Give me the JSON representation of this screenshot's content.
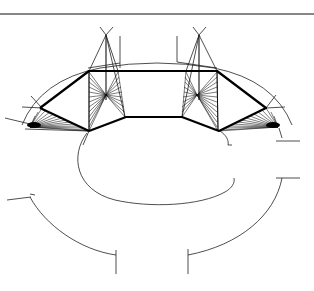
{
  "diagram": {
    "stroke_color": "#000000",
    "background": "#ffffff",
    "top_rule": {
      "x1": 0,
      "y1": 14,
      "x2": 314,
      "y2": 14
    },
    "frame_polygon": [
      [
        40,
        108
      ],
      [
        89,
        71
      ],
      [
        217,
        71
      ],
      [
        266,
        108
      ],
      [
        219,
        131
      ],
      [
        182,
        117
      ],
      [
        126,
        117
      ],
      [
        89,
        131
      ],
      [
        40,
        108
      ]
    ],
    "inner_quads": {
      "left": [
        [
          89,
          71
        ],
        [
          125,
          117
        ]
      ],
      "right": [
        [
          217,
          71
        ],
        [
          182,
          117
        ]
      ]
    },
    "fan_centers": {
      "left_top": [
        106,
        95
      ],
      "right_top": [
        197,
        95
      ],
      "left_bottom": [
        30,
        127
      ],
      "right_bottom": [
        278,
        127
      ]
    },
    "apexes": {
      "left": [
        106,
        35
      ],
      "right": [
        199,
        35
      ]
    },
    "ellipse_arc": {
      "cx": 157,
      "cy": 166,
      "rx": 80,
      "ry": 36
    },
    "outer_arcs": {
      "left": {
        "start": [
          30,
          197
        ],
        "end": [
          116,
          255
        ]
      },
      "right": {
        "start": [
          282,
          178
        ],
        "end": [
          188,
          255
        ]
      }
    }
  }
}
